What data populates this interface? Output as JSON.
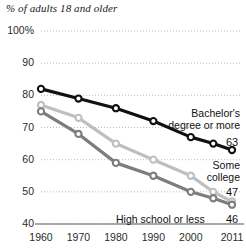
{
  "chart_data": {
    "type": "line",
    "title": "% of adults 18 and older",
    "xlabel": "",
    "ylabel": "",
    "ylim": [
      40,
      100
    ],
    "yticks": [
      "100%",
      "90",
      "80",
      "70",
      "60",
      "50",
      "40"
    ],
    "ytick_values": [
      100,
      90,
      80,
      70,
      60,
      50,
      40
    ],
    "xticks": [
      "1960",
      "1970",
      "1980",
      "1990",
      "2000",
      "2011"
    ],
    "xtick_values": [
      1960,
      1970,
      1980,
      1990,
      2000,
      2011
    ],
    "x": [
      1960,
      1970,
      1980,
      1990,
      2000,
      2006,
      2011
    ],
    "grid": true,
    "legend_position": "inline-right-labels",
    "series": [
      {
        "name": "Bachelor's degree or more",
        "label_line1": "Bachelor's",
        "label_line2": "degree or more",
        "color": "#111111",
        "end_value": 63,
        "values": [
          82,
          79,
          76,
          72,
          67,
          65,
          63
        ]
      },
      {
        "name": "Some college",
        "label_line1": "Some",
        "label_line2": "college",
        "color": "#bfbfbf",
        "end_value": 47,
        "values": [
          77,
          73,
          65,
          60,
          55,
          50,
          47
        ]
      },
      {
        "name": "High school or less",
        "label_line1": "High school or less",
        "label_line2": "",
        "color": "#7d7d7d",
        "end_value": 46,
        "values": [
          75,
          68,
          59,
          55,
          50,
          48,
          46
        ]
      }
    ],
    "annotations": [
      {
        "text": "Bachelor's",
        "series": "Bachelor's degree or more"
      },
      {
        "text": "degree or more",
        "series": "Bachelor's degree or more"
      },
      {
        "text": "63",
        "series": "Bachelor's degree or more"
      },
      {
        "text": "Some",
        "series": "Some college"
      },
      {
        "text": "college",
        "series": "Some college"
      },
      {
        "text": "47",
        "series": "Some college"
      },
      {
        "text": "High school or less",
        "series": "High school or less"
      },
      {
        "text": "46",
        "series": "High school or less"
      }
    ]
  }
}
